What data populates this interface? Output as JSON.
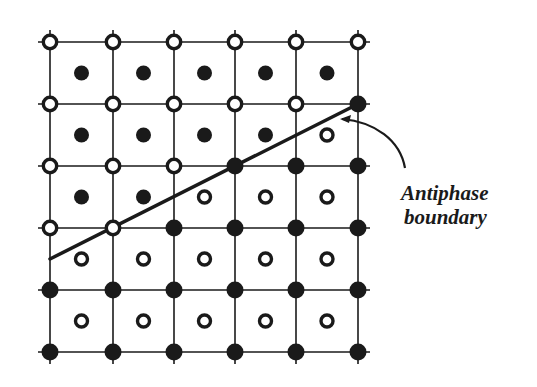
{
  "figure": {
    "label_lines": [
      "Antiphase",
      "boundary"
    ],
    "colors": {
      "ink": "#1a1a1a",
      "background": "#ffffff",
      "open_fill": "#ffffff"
    },
    "grid": {
      "x": [
        50,
        113,
        174,
        235,
        296,
        358
      ],
      "y": [
        42,
        104,
        166,
        228,
        290,
        352
      ],
      "overhang": 12
    },
    "corner_atoms": [
      [
        "open",
        "open",
        "open",
        "open",
        "open",
        "open"
      ],
      [
        "open",
        "open",
        "open",
        "open",
        "open",
        "filled"
      ],
      [
        "open",
        "open",
        "open",
        "filled",
        "filled",
        "filled"
      ],
      [
        "open",
        "open",
        "filled",
        "filled",
        "filled",
        "filled"
      ],
      [
        "filled",
        "filled",
        "filled",
        "filled",
        "filled",
        "filled"
      ],
      [
        "filled",
        "filled",
        "filled",
        "filled",
        "filled",
        "filled"
      ]
    ],
    "center_atoms": [
      [
        "filled",
        "filled",
        "filled",
        "filled",
        "filled"
      ],
      [
        "filled",
        "filled",
        "filled",
        "filled",
        "open"
      ],
      [
        "filled",
        "filled",
        "open",
        "open",
        "open"
      ],
      [
        "open",
        "open",
        "open",
        "open",
        "open"
      ],
      [
        "open",
        "open",
        "open",
        "open",
        "open"
      ]
    ],
    "boundary_line": {
      "x1": 50,
      "y1": 259,
      "x2": 358,
      "y2": 104
    },
    "arrow": {
      "path": "M405,168 C400,140 375,122 342,119",
      "tip": [
        340,
        119
      ]
    }
  }
}
